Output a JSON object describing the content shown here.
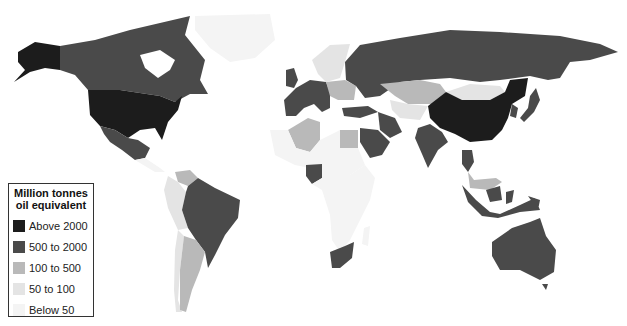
{
  "legend": {
    "title_line1": "Million tonnes",
    "title_line2": "oil equivalent",
    "classes": [
      {
        "label": "Above 2000",
        "color": "#1c1c1c"
      },
      {
        "label": "500 to 2000",
        "color": "#4a4a4a"
      },
      {
        "label": "100 to 500",
        "color": "#b9b9b9"
      },
      {
        "label": "50 to 100",
        "color": "#e4e4e4"
      },
      {
        "label": "Below 50",
        "color": "#f4f4f4"
      }
    ]
  },
  "regions": [
    {
      "name": "United States",
      "class": 0
    },
    {
      "name": "China",
      "class": 0
    },
    {
      "name": "Canada",
      "class": 1
    },
    {
      "name": "Mexico",
      "class": 1
    },
    {
      "name": "Brazil",
      "class": 1
    },
    {
      "name": "Russia",
      "class": 1
    },
    {
      "name": "Western Europe",
      "class": 1
    },
    {
      "name": "Turkey",
      "class": 1
    },
    {
      "name": "Iran",
      "class": 1
    },
    {
      "name": "Saudi Arabia",
      "class": 1
    },
    {
      "name": "India",
      "class": 1
    },
    {
      "name": "Japan",
      "class": 1
    },
    {
      "name": "South Korea",
      "class": 1
    },
    {
      "name": "Indonesia",
      "class": 1
    },
    {
      "name": "Thailand",
      "class": 1
    },
    {
      "name": "Australia",
      "class": 1
    },
    {
      "name": "South Africa",
      "class": 1
    },
    {
      "name": "Nigeria",
      "class": 1
    },
    {
      "name": "Ukraine",
      "class": 1
    },
    {
      "name": "Kazakhstan",
      "class": 2
    },
    {
      "name": "Algeria",
      "class": 2
    },
    {
      "name": "Egypt",
      "class": 2
    },
    {
      "name": "Argentina",
      "class": 2
    },
    {
      "name": "Venezuela",
      "class": 2
    },
    {
      "name": "Eastern Europe",
      "class": 2
    },
    {
      "name": "Malaysia",
      "class": 2
    },
    {
      "name": "Scandinavia",
      "class": 3
    },
    {
      "name": "Mongolia",
      "class": 3
    },
    {
      "name": "Central Asia",
      "class": 3
    },
    {
      "name": "Colombia-Peru",
      "class": 3
    },
    {
      "name": "Chile",
      "class": 3
    },
    {
      "name": "Central Africa",
      "class": 4
    },
    {
      "name": "Greenland",
      "class": 4
    },
    {
      "name": "Sahara",
      "class": 4
    },
    {
      "name": "East Africa",
      "class": 4
    }
  ]
}
